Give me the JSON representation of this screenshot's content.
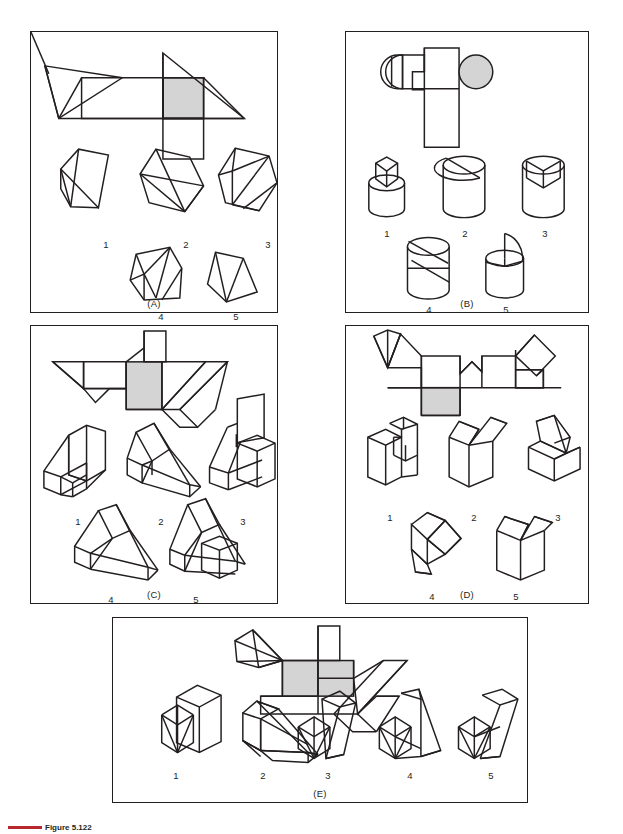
{
  "figure": {
    "caption_prefix": "Figure",
    "caption_number": "5.122",
    "accent_color": "#b8272e"
  },
  "style": {
    "line_color": "#231f20",
    "shade_color": "#d4d4d4",
    "background": "#ffffff"
  },
  "panels": [
    {
      "id": "A",
      "label": "(A)",
      "pattern_description": "flat pattern development with one shaded square face",
      "options": [
        {
          "number": "1",
          "x": 75,
          "y": 207
        },
        {
          "number": "2",
          "x": 155,
          "y": 207
        },
        {
          "number": "3",
          "x": 237,
          "y": 207
        },
        {
          "number": "4",
          "x": 130,
          "y": 295
        },
        {
          "number": "5",
          "x": 205,
          "y": 295
        }
      ]
    },
    {
      "id": "B",
      "label": "(B)",
      "pattern_description": "flat pattern with rounded ends and one shaded circle",
      "options": [
        {
          "number": "1",
          "x": 57,
          "y": 205
        },
        {
          "number": "2",
          "x": 133,
          "y": 205
        },
        {
          "number": "3",
          "x": 210,
          "y": 205
        },
        {
          "number": "4",
          "x": 93,
          "y": 285
        },
        {
          "number": "5",
          "x": 170,
          "y": 285
        }
      ]
    },
    {
      "id": "C",
      "label": "(C)",
      "pattern_description": "flat pattern with triangular flaps and one shaded square",
      "options": [
        {
          "number": "1",
          "x": 47,
          "y": 200
        },
        {
          "number": "2",
          "x": 130,
          "y": 200
        },
        {
          "number": "3",
          "x": 212,
          "y": 200
        },
        {
          "number": "4",
          "x": 80,
          "y": 278
        },
        {
          "number": "5",
          "x": 165,
          "y": 278
        }
      ]
    },
    {
      "id": "D",
      "label": "(D)",
      "pattern_description": "flat pattern with notched faces and one shaded square",
      "options": [
        {
          "number": "1",
          "x": 45,
          "y": 190
        },
        {
          "number": "2",
          "x": 130,
          "y": 190
        },
        {
          "number": "3",
          "x": 215,
          "y": 190
        },
        {
          "number": "4",
          "x": 88,
          "y": 275
        },
        {
          "number": "5",
          "x": 173,
          "y": 275
        }
      ]
    },
    {
      "id": "E",
      "label": "(E)",
      "pattern_description": "flat pattern with pentagon flap and one shaded square",
      "options": [
        {
          "number": "1",
          "x": 45,
          "y": 157
        },
        {
          "number": "2",
          "x": 130,
          "y": 157
        },
        {
          "number": "3",
          "x": 217,
          "y": 157
        },
        {
          "number": "4",
          "x": 300,
          "y": 157
        },
        {
          "number": "5",
          "x": 383,
          "y": 157
        }
      ]
    }
  ]
}
